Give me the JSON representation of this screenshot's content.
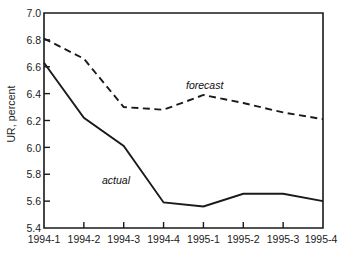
{
  "chart_data": {
    "type": "line",
    "title": "",
    "xlabel": "",
    "ylabel": "UR, percent",
    "categories": [
      "1994-1",
      "1994-2",
      "1994-3",
      "1994-4",
      "1995-1",
      "1995-2",
      "1995-3",
      "1995-4"
    ],
    "ylim": [
      5.4,
      7.0
    ],
    "yticks": [
      "5.4",
      "5.6",
      "5.8",
      "6.0",
      "6.2",
      "6.4",
      "6.6",
      "6.8",
      "7.0"
    ],
    "ytick_values": [
      5.4,
      5.6,
      5.8,
      6.0,
      6.2,
      6.4,
      6.6,
      6.8,
      7.0
    ],
    "grid": false,
    "legend_position": "inline-annotations",
    "series": [
      {
        "name": "actual",
        "style": "solid",
        "color": "#1a1a1a",
        "values": [
          6.63,
          6.22,
          6.01,
          5.59,
          5.56,
          5.655,
          5.655,
          5.6
        ]
      },
      {
        "name": "forecast",
        "style": "dashed",
        "color": "#1a1a1a",
        "values": [
          6.81,
          6.66,
          6.3,
          6.28,
          6.39,
          6.33,
          6.26,
          6.21
        ]
      }
    ],
    "annotations": [
      {
        "text": "forecast",
        "x_category": "1995-1",
        "value": 6.46
      },
      {
        "text": "actual",
        "x_category": "1994-3",
        "value": 5.79
      }
    ]
  }
}
